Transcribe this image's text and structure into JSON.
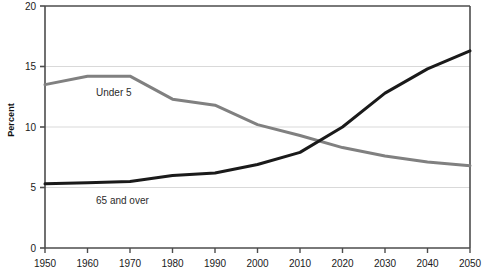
{
  "chart_data": {
    "type": "line",
    "title": "",
    "xlabel": "",
    "ylabel": "Percent",
    "xlim": [
      1950,
      2050
    ],
    "ylim": [
      0,
      20
    ],
    "grid": true,
    "grid_axis": "y",
    "legend_position": "inline-annotations",
    "x": [
      1950,
      1960,
      1970,
      1980,
      1990,
      2000,
      2010,
      2020,
      2030,
      2040,
      2050
    ],
    "xticks": [
      "1950",
      "1960",
      "1970",
      "1980",
      "1990",
      "2000",
      "2010",
      "2020",
      "2030",
      "2040",
      "2050"
    ],
    "yticks": [
      "0",
      "5",
      "10",
      "15",
      "20"
    ],
    "ytick_values": [
      0,
      5,
      10,
      15,
      20
    ],
    "series": [
      {
        "name": "Under 5",
        "color": "#808080",
        "values": [
          13.5,
          14.2,
          14.2,
          12.3,
          11.8,
          10.2,
          9.3,
          8.3,
          7.6,
          7.1,
          6.8
        ],
        "annotation": {
          "text": "Under 5",
          "x": 1962,
          "y": 12.6
        }
      },
      {
        "name": "65 and over",
        "color": "#1a1a1a",
        "values": [
          5.3,
          5.4,
          5.5,
          6.0,
          6.2,
          6.9,
          7.9,
          10.0,
          12.8,
          14.8,
          16.3
        ],
        "annotation": {
          "text": "65 and over",
          "x": 1962,
          "y": 3.6
        }
      }
    ]
  },
  "axis": {
    "y_title": "Percent"
  },
  "colors": {
    "axis": "#4d4d4d",
    "grid": "#d9d9d9",
    "under5": "#808080",
    "over65": "#1a1a1a",
    "background": "#ffffff"
  }
}
